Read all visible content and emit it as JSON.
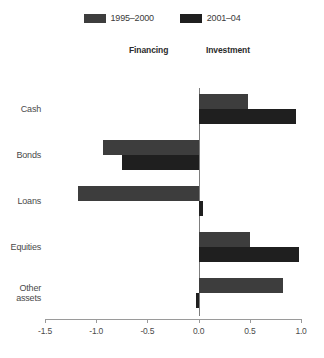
{
  "chart_data": {
    "type": "bar",
    "orientation": "horizontal",
    "title": "",
    "subtitle": "",
    "xlabel": "",
    "ylabel": "",
    "xlim": [
      -1.5,
      1.0
    ],
    "xticks": [
      -1.5,
      -1.0,
      -0.5,
      0.0,
      0.5,
      1.0
    ],
    "xtick_labels": [
      "-1.5",
      "-1.0",
      "-0.5",
      "0.0",
      "0.5",
      "1.0"
    ],
    "grid": false,
    "legend_position": "top-center",
    "categories": [
      "Cash",
      "Bonds",
      "Loans",
      "Equities",
      "Other assets"
    ],
    "category_lines": [
      [
        "Cash"
      ],
      [
        "Bonds"
      ],
      [
        "Loans"
      ],
      [
        "Equities"
      ],
      [
        "Other",
        "assets"
      ]
    ],
    "series": [
      {
        "name": "1995–2000",
        "color": "#3d3d3d",
        "values": [
          0.48,
          -0.93,
          -1.18,
          0.5,
          0.82
        ]
      },
      {
        "name": "2001–04",
        "color": "#1f1f1f",
        "values": [
          0.95,
          -0.75,
          0.04,
          0.98,
          -0.03
        ]
      }
    ],
    "annotations": [
      {
        "text": "Financing",
        "side": "left",
        "role": "column-header"
      },
      {
        "text": "Investment",
        "side": "right",
        "role": "column-header"
      }
    ]
  },
  "legend": {
    "items": [
      {
        "label": "1995–2000",
        "color": "#3d3d3d"
      },
      {
        "label": "2001–04",
        "color": "#1f1f1f"
      }
    ]
  },
  "headers": {
    "financing": "Financing",
    "investment": "Investment"
  }
}
